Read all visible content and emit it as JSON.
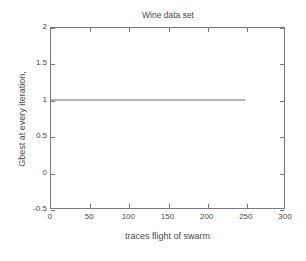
{
  "chart_data": {
    "type": "line",
    "title": "Wine data set",
    "xlabel": "traces flight of swarm",
    "ylabel": "Gbest at every iteration,",
    "xlim": [
      0,
      300
    ],
    "ylim": [
      -0.5,
      2
    ],
    "xticks": [
      0,
      50,
      100,
      150,
      200,
      250,
      300
    ],
    "xticklabels": [
      "0",
      "50",
      "100",
      "150",
      "200",
      "250",
      "300"
    ],
    "yticks": [
      -0.5,
      0,
      0.5,
      1,
      1.5,
      2
    ],
    "yticklabels": [
      "-0.5",
      "0",
      "0.5",
      "1",
      "1.5",
      "2"
    ],
    "grid": false,
    "legend": null,
    "legend_position": "none",
    "series": [
      {
        "name": "Gbest",
        "color": "#6b6b6b",
        "linewidth": 1,
        "x": [
          0,
          25,
          50,
          75,
          100,
          125,
          150,
          175,
          200,
          225,
          250
        ],
        "values": [
          1,
          1,
          1,
          1,
          1,
          1,
          1,
          1,
          1,
          1,
          1
        ]
      }
    ],
    "annotations": [],
    "axes_color": "#7a7a7a",
    "background_color": "#ffffff",
    "text_color": "#4a4a4a"
  }
}
